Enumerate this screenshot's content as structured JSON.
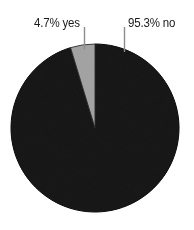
{
  "chart_data": {
    "type": "pie",
    "title": "",
    "subtitle": "",
    "xlabel": "",
    "ylabel": "",
    "grid": false,
    "legend_position": "none",
    "labels_position": "outside-top",
    "categories": [
      "no",
      "yes"
    ],
    "values": [
      95.3,
      4.7
    ],
    "value_unit": "%",
    "slices": [
      {
        "name": "no",
        "value": 95.3,
        "label": "95.3% no",
        "color": "#0d0d0d",
        "outline_color": "#000000",
        "start_angle_deg": 0.0,
        "end_angle_deg": 343.08
      },
      {
        "name": "yes",
        "value": 4.7,
        "label": "4.7% yes",
        "color": "#a2a2a2",
        "outline_color": "#2b2b2b",
        "start_angle_deg": 343.08,
        "end_angle_deg": 360.0
      }
    ],
    "annotations": [
      {
        "name": "yes-callout",
        "text": "4.7% yes",
        "leader_line": true,
        "leader_color": "#8c8c8c"
      },
      {
        "name": "no-callout",
        "text": "95.3% no",
        "leader_line": true,
        "leader_color": "#8c8c8c"
      }
    ]
  },
  "chart": {
    "label_yes": "4.7% yes",
    "label_no": "95.3% no",
    "background_color": "#ffffff",
    "text_color": "#1a1a1a"
  }
}
